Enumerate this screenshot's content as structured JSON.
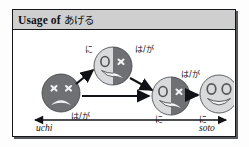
{
  "figure": {
    "title_prefix": "Usage of ",
    "title_japanese": "あげる",
    "colors": {
      "frame_border": "#15171a",
      "title_bar_bg": "#cfcfcf",
      "face_dark": "#6e7074",
      "face_light": "#d9dadc",
      "arrow": "#101215",
      "shadow": "#55585d"
    }
  },
  "diagram": {
    "type": "flow-diagram",
    "axis": {
      "left_label": "uchi",
      "right_label": "soto",
      "direction": "double-headed"
    },
    "nodes": [
      {
        "id": "face-1",
        "name": "sad-face-dark",
        "fill": "dark",
        "expression": "frown",
        "eyes": "x-x",
        "x": 48,
        "y": 63,
        "r": 19
      },
      {
        "id": "face-2",
        "name": "split-face-upper",
        "fill": "split",
        "expression": "half-smile-half-frown",
        "eyes": "o-x",
        "x": 100,
        "y": 36,
        "r": 19
      },
      {
        "id": "face-3",
        "name": "split-face-lower",
        "fill": "split",
        "expression": "half-smile-half-frown",
        "eyes": "o-x",
        "x": 158,
        "y": 66,
        "r": 19
      },
      {
        "id": "face-4",
        "name": "happy-face-light",
        "fill": "light",
        "expression": "smile",
        "eyes": "o-o",
        "x": 206,
        "y": 64,
        "r": 19
      }
    ],
    "labels": [
      {
        "id": "label-1",
        "name": "particle-wa-ga-face1",
        "text": "は/が",
        "x": 58,
        "y": 83
      },
      {
        "id": "label-2",
        "name": "particle-ni-face2",
        "text": "に",
        "x": 72,
        "y": 16
      },
      {
        "id": "label-3",
        "name": "particle-wa-ga-face2",
        "text": "は/が",
        "x": 122,
        "y": 16
      },
      {
        "id": "label-4",
        "name": "particle-ni-face3",
        "text": "に",
        "x": 142,
        "y": 86
      },
      {
        "id": "label-5",
        "name": "particle-wa-ga-face3",
        "text": "は/が",
        "x": 168,
        "y": 41
      },
      {
        "id": "label-6",
        "name": "particle-ni-face4",
        "text": "に",
        "x": 186,
        "y": 86
      }
    ],
    "arrows": [
      {
        "id": "arrow-1",
        "name": "arrow-face1-to-face2",
        "from": "face-1",
        "to": "face-2",
        "style": "diagonal-up"
      },
      {
        "id": "arrow-2",
        "name": "arrow-face2-to-face3",
        "from": "face-2",
        "to": "face-3",
        "style": "diagonal-down"
      },
      {
        "id": "arrow-3",
        "name": "arrow-face1-to-face3",
        "from": "face-1",
        "to": "face-3",
        "style": "horizontal-long"
      },
      {
        "id": "arrow-4",
        "name": "arrow-face3-to-face4",
        "from": "face-3",
        "to": "face-4",
        "style": "horizontal-short"
      }
    ]
  }
}
